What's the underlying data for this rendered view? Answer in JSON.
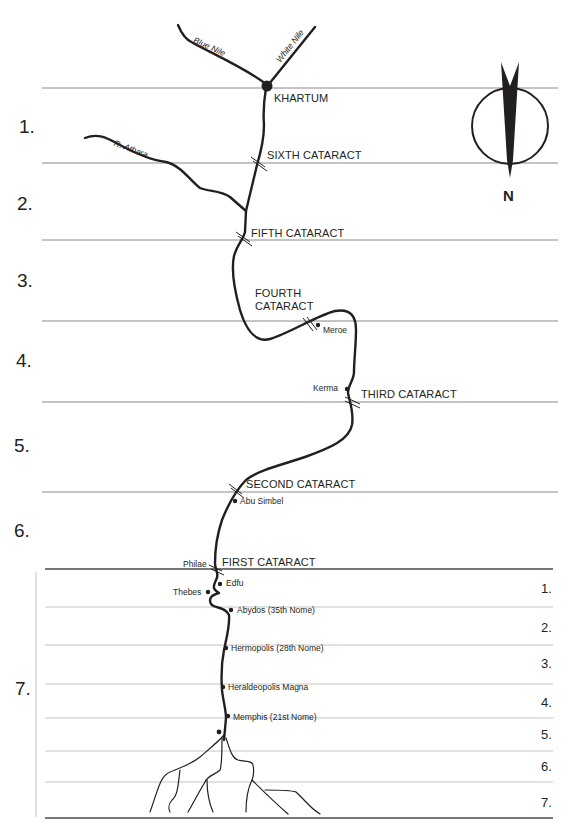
{
  "diagram": {
    "type": "schematic map of the Nile river divided into regions",
    "compass": {
      "label": "N"
    },
    "upper_regions": [
      "1.",
      "2.",
      "3.",
      "4.",
      "5.",
      "6.",
      "7."
    ],
    "lower_regions": [
      "1.",
      "2.",
      "3.",
      "4.",
      "5.",
      "6.",
      "7."
    ],
    "rivers": {
      "blue_nile": "Blue Nile",
      "white_nile": "White Nile",
      "atbara": "R. Atbara"
    },
    "cities": {
      "khartum": "KHARTUM",
      "meroe": "Meroe",
      "kerma": "Kerma",
      "abu_simbel": "Abu Simbel",
      "philae": "Philae",
      "edfu": "Edfu",
      "thebes": "Thebes",
      "abydos": "Abydos (35th Nome)",
      "hermopolis": "Hermopolis (28th Nome)",
      "heraldeopolis": "Heraldeopolis Magna",
      "memphis": "Memphis (21st Nome)"
    },
    "cataracts": {
      "sixth": "SIXTH CATARACT",
      "fifth": "FIFTH CATARACT",
      "fourth_line1": "FOURTH",
      "fourth_line2": "CATARACT",
      "third": "THIRD CATARACT",
      "second": "SECOND CATARACT",
      "first": "FIRST CATARACT"
    },
    "colors": {
      "river": "#231f20",
      "divider": "#8a8a8a",
      "divider_light": "#c4c4c4",
      "text": "#231f20"
    }
  }
}
